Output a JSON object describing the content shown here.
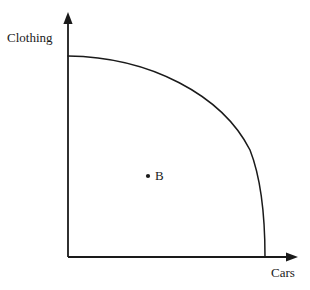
{
  "figure": {
    "type": "economics-ppf-diagram",
    "background_color": "#ffffff",
    "line_color": "#1a1a1a"
  },
  "axes": {
    "y": {
      "label": "Clothing",
      "arrow": "up-arrow-icon",
      "origin_px": [
        68,
        257
      ],
      "tip_px": [
        68,
        14
      ]
    },
    "x": {
      "label": "Cars",
      "arrow": "right-arrow-icon",
      "origin_px": [
        68,
        257
      ],
      "tip_px": [
        297,
        257
      ]
    }
  },
  "curve": {
    "name": "production-possibilities-frontier",
    "y_intercept_px": [
      68,
      56
    ],
    "x_intercept_px": [
      265,
      257
    ],
    "path": "M 68 56 C 150 57 222 95 250 150 C 261 178 265 215 265 257"
  },
  "points": [
    {
      "id": "B",
      "label": "B",
      "marker": "dot",
      "dot_px": [
        148,
        176
      ],
      "label_px": [
        155,
        168
      ]
    }
  ],
  "chart_data": {
    "type": "line",
    "title": "",
    "xlabel": "Cars",
    "ylabel": "Clothing",
    "grid": false,
    "legend": false,
    "xlim": [
      0,
      1
    ],
    "ylim": [
      0,
      1
    ],
    "series": [
      {
        "name": "Production Possibilities Frontier",
        "x": [
          0.0,
          0.15,
          0.3,
          0.45,
          0.6,
          0.72,
          0.82,
          0.9,
          0.96,
          1.0
        ],
        "y": [
          1.0,
          0.99,
          0.96,
          0.91,
          0.83,
          0.72,
          0.6,
          0.45,
          0.27,
          0.0
        ]
      }
    ],
    "annotations": [
      {
        "text": "B",
        "x": 0.41,
        "y": 0.4,
        "marker": "dot"
      }
    ]
  }
}
